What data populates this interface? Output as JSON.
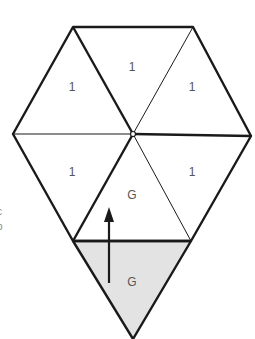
{
  "diagram": {
    "shape": "hexagon-of-triangles-with-extra-bottom-triangle",
    "colors": {
      "stroke": "#1a1a1a",
      "shaded_fill": "#e3e3e3",
      "label": "#555555"
    },
    "triangles": [
      {
        "id": "top-left",
        "label": "1"
      },
      {
        "id": "top",
        "label": "1"
      },
      {
        "id": "top-right",
        "label": "1"
      },
      {
        "id": "bottom-left",
        "label": "1"
      },
      {
        "id": "bottom-center",
        "label": "G"
      },
      {
        "id": "bottom-right",
        "label": "1"
      },
      {
        "id": "extra-bottom",
        "label": "G",
        "shaded": true
      }
    ],
    "arrow": {
      "direction": "up",
      "from": "extra-bottom",
      "to": "bottom-center"
    },
    "edge_fragments": [
      "c",
      "b"
    ]
  }
}
